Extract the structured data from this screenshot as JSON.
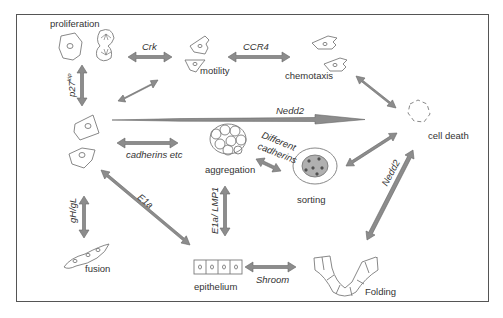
{
  "diagram": {
    "colors": {
      "arrow": "#8a8a8a",
      "arrow_edge": "#5e5e5e",
      "cell_stroke": "#7a7a7a",
      "frame": "#555555",
      "text": "#333333"
    },
    "nodes": {
      "proliferation": "proliferation",
      "motility": "motility",
      "chemotaxis": "chemotaxis",
      "cell_death": "cell death",
      "aggregation": "aggregation",
      "sorting": "sorting",
      "fusion": "fusion",
      "epithelium": "epithelium",
      "folding": "Folding"
    },
    "edges": {
      "crk": "Crk",
      "ccr4": "CCR4",
      "p27_base": "p27",
      "p27_sup": "kip",
      "nedd2_horizontal": "Nedd2",
      "cadherins_etc": "cadherins etc",
      "different_cadherins_1": "Different",
      "different_cadherins_2": "cadherins",
      "nedd2_diagonal": "Nedd2",
      "e1a": "E1a",
      "e1a_lmp1": "E1a/ LMP1",
      "ghgl": "gH/gL",
      "shroom": "Shroom"
    }
  }
}
